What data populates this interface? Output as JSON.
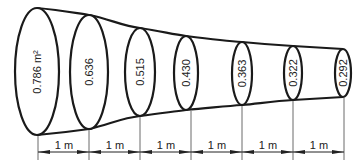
{
  "diagram": {
    "sections": [
      {
        "area": "0.786 m²",
        "value": 0.786,
        "unit": "m²"
      },
      {
        "area": "0.636",
        "value": 0.636
      },
      {
        "area": "0.515",
        "value": 0.515
      },
      {
        "area": "0.430",
        "value": 0.43
      },
      {
        "area": "0.363",
        "value": 0.363
      },
      {
        "area": "0.322",
        "value": 0.322
      },
      {
        "area": "0.292",
        "value": 0.292
      }
    ],
    "spacings": [
      "1 m",
      "1 m",
      "1 m",
      "1 m",
      "1 m",
      "1 m"
    ],
    "colors": {
      "line": "#1a1a1a",
      "background": "#ffffff"
    }
  }
}
